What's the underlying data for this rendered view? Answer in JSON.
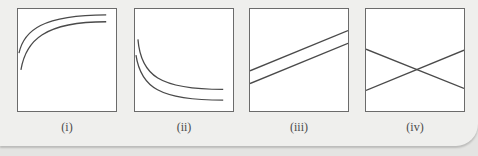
{
  "figure": {
    "panels": [
      {
        "id": "i",
        "label": "(i)",
        "description": "two concave-down saturating curves rising from left and leveling off at top"
      },
      {
        "id": "ii",
        "label": "(ii)",
        "description": "two decaying curves falling from left and leveling off at bottom"
      },
      {
        "id": "iii",
        "label": "(iii)",
        "description": "two parallel straight lines rising left to right"
      },
      {
        "id": "iv",
        "label": "(iv)",
        "description": "two straight lines crossing in an X shape"
      }
    ],
    "colors": {
      "line": "#4a4a4a",
      "box_border": "#6b6b6b",
      "box_fill": "#ffffff",
      "background": "#efefed"
    }
  }
}
